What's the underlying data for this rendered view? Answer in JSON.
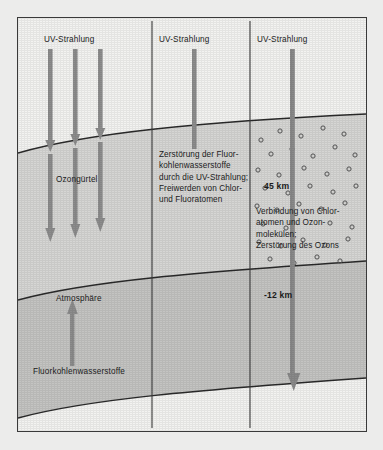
{
  "figure": {
    "title_text": "",
    "colors": {
      "frame_border": "#3a3a3a",
      "sky_band": "#f2f2f0",
      "ozone_band": "#d4d4d2",
      "atmosphere_band": "#c2c2c0",
      "ground_band": "#f2f2f0",
      "arrow": "#8a8a8a",
      "arrow_dark": "#7b7b7b",
      "curve": "#2a2a2a",
      "divider": "#3a3a3a",
      "text": "#1c1c1c",
      "dot_stroke": "#5a5a5a"
    },
    "panels": [
      {
        "name": "left",
        "uv_label": "UV-Strahlung"
      },
      {
        "name": "middle",
        "uv_label": "UV-Strahlung"
      },
      {
        "name": "right",
        "uv_label": "UV-Strahlung"
      }
    ],
    "labels": {
      "uv_left": "UV-Strahlung",
      "uv_middle": "UV-Strahlung",
      "uv_right": "UV-Strahlung",
      "ozone_belt": "Ozongürtel",
      "atmosphere": "Atmosphäre",
      "cfc_bottom": "Fluorkohlenwasserstoffe",
      "altitude_upper": "45 km",
      "altitude_lower": "-12 km"
    },
    "text_blocks": {
      "middle_block": "Zerstörung der Fluor-\nkohlenwasserstoffe\ndurch die UV-Strahlung;\nFreiwerden von Chlor-\nund Fluoratomen",
      "right_block": "Verbindung von Chlor-\natomen und Ozon-\nmolekülen;\nZerstörung des Ozons"
    },
    "arrows": {
      "left_group_count": 3,
      "middle_count": 1,
      "right_count": 1,
      "atmosphere_up_count": 1
    },
    "ozone_dots_count": 38
  }
}
